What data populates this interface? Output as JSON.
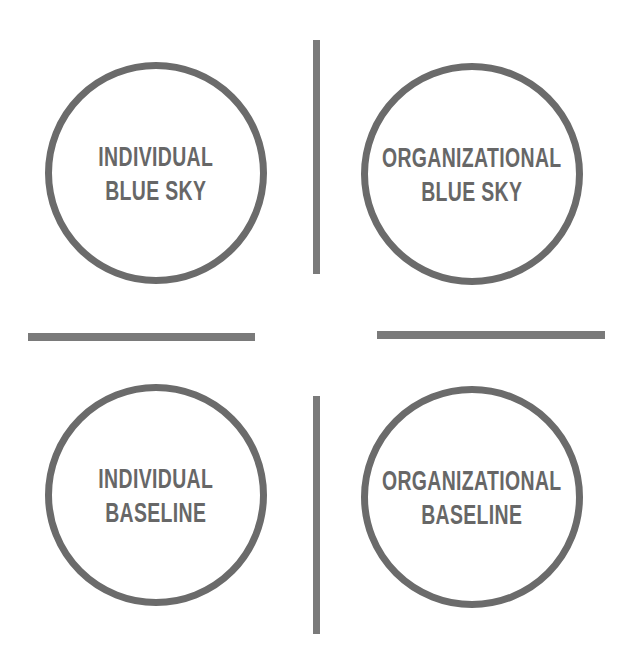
{
  "diagram": {
    "title": "",
    "quadrants": [
      {
        "id": "top-left",
        "lines": [
          "INDIVIDUAL",
          "BLUE SKY"
        ]
      },
      {
        "id": "top-right",
        "lines": [
          "ORGANIZATIONAL",
          "BLUE SKY"
        ]
      },
      {
        "id": "bottom-left",
        "lines": [
          "INDIVIDUAL",
          "BASELINE"
        ]
      },
      {
        "id": "bottom-right",
        "lines": [
          "ORGANIZATIONAL",
          "BASELINE"
        ]
      }
    ],
    "dividers": [
      {
        "orientation": "vertical",
        "position": "top"
      },
      {
        "orientation": "vertical",
        "position": "bottom"
      },
      {
        "orientation": "horizontal",
        "position": "left"
      },
      {
        "orientation": "horizontal",
        "position": "right"
      }
    ],
    "colors": {
      "stroke": "#6b6b6b",
      "text": "#676767",
      "divider": "#7a7a7a",
      "background": "#ffffff"
    }
  }
}
